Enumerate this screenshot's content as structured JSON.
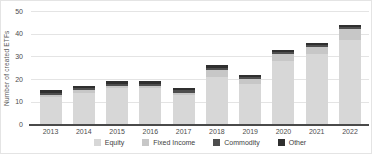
{
  "chart_data": {
    "type": "bar",
    "stacked": true,
    "title": "",
    "ylabel": "Number of created ETFs",
    "xlabel": "",
    "categories": [
      "2013",
      "2014",
      "2015",
      "2016",
      "2017",
      "2018",
      "2019",
      "2020",
      "2021",
      "2022"
    ],
    "series": [
      {
        "name": "Equity",
        "color": "#d7d7d7",
        "values": [
          12,
          14,
          16,
          16,
          13,
          21,
          18,
          28,
          31,
          37
        ]
      },
      {
        "name": "Fixed Income",
        "color": "#c7c7c7",
        "values": [
          1,
          1,
          1,
          1,
          1,
          3,
          2,
          3,
          3,
          5
        ]
      },
      {
        "name": "Commodity",
        "color": "#4e4e4e",
        "values": [
          1,
          1,
          1,
          1,
          1,
          1,
          1,
          1,
          1,
          1
        ]
      },
      {
        "name": "Other",
        "color": "#2f2f2f",
        "values": [
          1,
          1,
          1,
          1,
          1,
          1,
          1,
          1,
          1,
          1
        ]
      }
    ],
    "totals": [
      15,
      17,
      19,
      19,
      16,
      26,
      22,
      33,
      36,
      44
    ],
    "ylim": [
      0,
      50
    ],
    "yticks": [
      0,
      10,
      20,
      30,
      40,
      50
    ],
    "grid": true,
    "legend_position": "bottom"
  },
  "colors": {
    "grid": "#e4e4e4",
    "axis_line": "#4a4a4a",
    "tick_text": "#4c4c4c",
    "background": "#ffffff"
  }
}
